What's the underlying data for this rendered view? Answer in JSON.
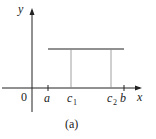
{
  "figure": {
    "caption": "(a)",
    "axes": {
      "x_label": "x",
      "y_label": "y",
      "origin_label": "0"
    },
    "ticks": [
      {
        "label": "a",
        "sub": ""
      },
      {
        "label": "c",
        "sub": "1"
      },
      {
        "label": "c",
        "sub": "2"
      },
      {
        "label": "b",
        "sub": ""
      }
    ],
    "colors": {
      "stroke": "#222222",
      "guide": "#888888"
    }
  }
}
